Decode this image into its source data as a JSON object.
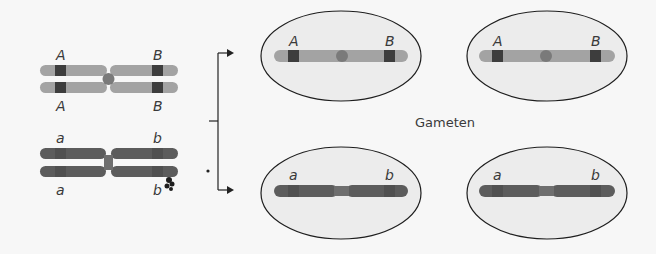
{
  "diagram": {
    "type": "meiosis-gamete-formation",
    "colors": {
      "background": "#f7f7f7",
      "light_chromosome": "#a3a3a3",
      "light_band": "#3d3d3d",
      "light_centromere": "#7a7a7a",
      "dark_chromosome": "#5c5c5c",
      "dark_band": "#474747",
      "dark_centromere": "#6e6e6e",
      "cell_fill": "#ececec",
      "cell_stroke": "#1e1e1e",
      "text": "#3a3a3a",
      "arrow": "#222222"
    },
    "parent_cell": {
      "chromosome_pair_1": {
        "alleles_top": [
          "A",
          "B"
        ],
        "alleles_bottom": [
          "A",
          "B"
        ],
        "shade": "light"
      },
      "chromosome_pair_2": {
        "alleles_top": [
          "a",
          "b"
        ],
        "alleles_bottom": [
          "a",
          "b"
        ],
        "shade": "dark"
      }
    },
    "gametes_label": "Gameten",
    "gametes": [
      {
        "position": "top-left",
        "alleles": [
          "A",
          "B"
        ],
        "shade": "light"
      },
      {
        "position": "top-right",
        "alleles": [
          "A",
          "B"
        ],
        "shade": "light"
      },
      {
        "position": "bottom-left",
        "alleles": [
          "a",
          "b"
        ],
        "shade": "dark"
      },
      {
        "position": "bottom-right",
        "alleles": [
          "a",
          "b"
        ],
        "shade": "dark"
      }
    ]
  }
}
